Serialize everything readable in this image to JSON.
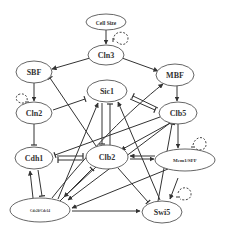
{
  "diagram": {
    "colors": {
      "line": "#333333",
      "node_border": "#555555",
      "text": "#333333",
      "background": "#ffffff"
    },
    "nodes": [
      {
        "id": "cellsize",
        "label": "Cell Size",
        "cx": 106,
        "cy": 22,
        "rx": 20,
        "ry": 8,
        "fs": 5.5
      },
      {
        "id": "cln3",
        "label": "Cln3",
        "cx": 106,
        "cy": 55,
        "rx": 18,
        "ry": 10,
        "fs": 8
      },
      {
        "id": "sbf",
        "label": "SBF",
        "cx": 34,
        "cy": 72,
        "rx": 18,
        "ry": 11,
        "fs": 8
      },
      {
        "id": "mbf",
        "label": "MBF",
        "cx": 175,
        "cy": 75,
        "rx": 19,
        "ry": 11,
        "fs": 8
      },
      {
        "id": "sic1",
        "label": "Sic1",
        "cx": 107,
        "cy": 91,
        "rx": 20,
        "ry": 11,
        "fs": 8
      },
      {
        "id": "cln2",
        "label": "Cln2",
        "cx": 34,
        "cy": 113,
        "rx": 18,
        "ry": 11,
        "fs": 8
      },
      {
        "id": "clb5",
        "label": "Clb5",
        "cx": 178,
        "cy": 113,
        "rx": 19,
        "ry": 11,
        "fs": 8
      },
      {
        "id": "cdh1",
        "label": "Cdh1",
        "cx": 34,
        "cy": 158,
        "rx": 19,
        "ry": 11,
        "fs": 8
      },
      {
        "id": "clb2",
        "label": "Clb2",
        "cx": 107,
        "cy": 157,
        "rx": 21,
        "ry": 12,
        "fs": 8
      },
      {
        "id": "mcm1",
        "label": "Mcm1/SFF",
        "cx": 185,
        "cy": 160,
        "rx": 30,
        "ry": 11,
        "fs": 5
      },
      {
        "id": "cdc20",
        "label": "Cdc20/Cdc14",
        "cx": 40,
        "cy": 210,
        "rx": 30,
        "ry": 12,
        "fs": 3.5
      },
      {
        "id": "swi5",
        "label": "Swi5",
        "cx": 162,
        "cy": 212,
        "rx": 20,
        "ry": 11,
        "fs": 8
      }
    ],
    "edges": [
      {
        "from": "Cell Size",
        "to": "Cln3",
        "type": "activation"
      },
      {
        "from": "Cln3",
        "to": "SBF",
        "type": "activation"
      },
      {
        "from": "Cln3",
        "to": "MBF",
        "type": "activation"
      },
      {
        "from": "SBF",
        "to": "Cln2",
        "type": "activation"
      },
      {
        "from": "MBF",
        "to": "Clb5",
        "type": "activation"
      },
      {
        "from": "Cln2",
        "to": "Sic1",
        "type": "inhibition"
      },
      {
        "from": "Cln2",
        "to": "Cdh1",
        "type": "inhibition"
      },
      {
        "from": "Clb5",
        "to": "Sic1",
        "type": "inhibition"
      },
      {
        "from": "Sic1",
        "to": "Clb5",
        "type": "inhibition"
      },
      {
        "from": "Sic1",
        "to": "Clb2",
        "type": "inhibition"
      },
      {
        "from": "Clb2",
        "to": "Sic1",
        "type": "inhibition"
      },
      {
        "from": "Clb2",
        "to": "SBF",
        "type": "inhibition"
      },
      {
        "from": "Clb2",
        "to": "MBF",
        "type": "inhibition"
      },
      {
        "from": "Clb5",
        "to": "Cdh1",
        "type": "inhibition"
      },
      {
        "from": "Clb5",
        "to": "Clb2",
        "type": "activation"
      },
      {
        "from": "Clb5",
        "to": "Mcm1/SFF",
        "type": "activation"
      },
      {
        "from": "Cdh1",
        "to": "Clb2",
        "type": "inhibition"
      },
      {
        "from": "Clb2",
        "to": "Cdh1",
        "type": "inhibition"
      },
      {
        "from": "Clb2",
        "to": "Mcm1/SFF",
        "type": "activation"
      },
      {
        "from": "Mcm1/SFF",
        "to": "Clb2",
        "type": "activation"
      },
      {
        "from": "Mcm1/SFF",
        "to": "Cdc20/Cdc14",
        "type": "activation"
      },
      {
        "from": "Mcm1/SFF",
        "to": "Swi5",
        "type": "activation"
      },
      {
        "from": "Clb2",
        "to": "Cdc20/Cdc14",
        "type": "activation"
      },
      {
        "from": "Cdc20/Cdc14",
        "to": "Clb2",
        "type": "inhibition"
      },
      {
        "from": "Clb2",
        "to": "Swi5",
        "type": "inhibition"
      },
      {
        "from": "Cdc20/Cdc14",
        "to": "Cdh1",
        "type": "activation"
      },
      {
        "from": "Cdh1",
        "to": "Cdc20/Cdc14",
        "type": "inhibition"
      },
      {
        "from": "Cdc20/Cdc14",
        "to": "Swi5",
        "type": "activation"
      },
      {
        "from": "Cdc20/Cdc14",
        "to": "Sic1",
        "type": "activation"
      },
      {
        "from": "Cdc20/Cdc14",
        "to": "Clb5",
        "type": "inhibition"
      },
      {
        "from": "Swi5",
        "to": "Sic1",
        "type": "activation"
      },
      {
        "from": "Cln3",
        "to": "Cln3",
        "type": "self-degradation"
      },
      {
        "from": "Cln2",
        "to": "Cln2",
        "type": "self-degradation"
      },
      {
        "from": "Mcm1/SFF",
        "to": "Mcm1/SFF",
        "type": "self-degradation"
      },
      {
        "from": "Swi5",
        "to": "Swi5",
        "type": "self-degradation"
      }
    ]
  }
}
